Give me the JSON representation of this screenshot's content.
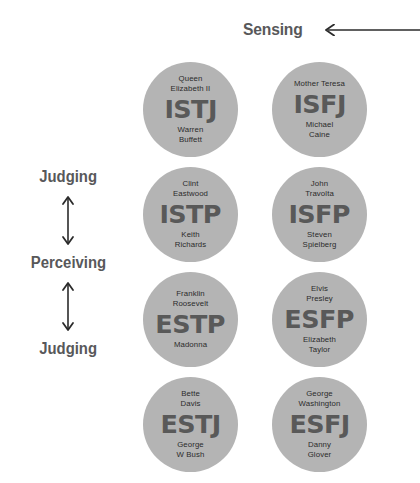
{
  "axes": {
    "top": {
      "label": "Sensing",
      "arrow_direction": "left",
      "arrow_icon": "arrow-left-icon"
    },
    "left": {
      "items": [
        {
          "label": "Judging",
          "kind": "label"
        },
        {
          "label": "",
          "kind": "arrow",
          "arrow_icon": "arrow-updown-icon"
        },
        {
          "label": "Perceiving",
          "kind": "label"
        },
        {
          "label": "",
          "kind": "arrow",
          "arrow_icon": "arrow-updown-icon"
        },
        {
          "label": "Judging",
          "kind": "label"
        }
      ]
    }
  },
  "colors": {
    "circle_fill": "#b4b4b4",
    "code_text": "#595959",
    "label_text": "#58585a",
    "person_text": "#2b2b2b",
    "background": "#ffffff"
  },
  "grid": {
    "columns": 2,
    "rows": 4,
    "cells": [
      {
        "code": "ISTJ",
        "top_person": "Queen\nElizabeth II",
        "bottom_person": "Warren\nBuffett",
        "column": 0,
        "row": 0
      },
      {
        "code": "ISFJ",
        "top_person": "Mother Teresa",
        "bottom_person": "Michael\nCaine",
        "column": 1,
        "row": 0
      },
      {
        "code": "ISTP",
        "top_person": "Clint\nEastwood",
        "bottom_person": "Keith\nRichards",
        "column": 0,
        "row": 1
      },
      {
        "code": "ISFP",
        "top_person": "John\nTravolta",
        "bottom_person": "Steven\nSpielberg",
        "column": 1,
        "row": 1
      },
      {
        "code": "ESTP",
        "top_person": "Franklin\nRoosevelt",
        "bottom_person": "Madonna",
        "column": 0,
        "row": 2
      },
      {
        "code": "ESFP",
        "top_person": "Elvis\nPresley",
        "bottom_person": "Elizabeth\nTaylor",
        "column": 1,
        "row": 2
      },
      {
        "code": "ESTJ",
        "top_person": "Bette\nDavis",
        "bottom_person": "George\nW Bush",
        "column": 0,
        "row": 3
      },
      {
        "code": "ESFJ",
        "top_person": "George\nWashington",
        "bottom_person": "Danny\nGlover",
        "column": 1,
        "row": 3
      }
    ]
  }
}
